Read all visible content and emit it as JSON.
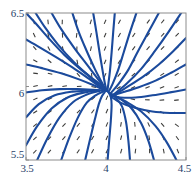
{
  "chart_data": {
    "type": "line",
    "title": "",
    "subtitle": "",
    "xlabel": "",
    "ylabel": "",
    "xlim": [
      3.5,
      4.5
    ],
    "ylim": [
      5.5,
      6.5
    ],
    "xticks": [
      3.5,
      4,
      4.5
    ],
    "xticklabels": [
      "3.5",
      "4",
      "4.5"
    ],
    "yticks": [
      5.5,
      6,
      6.5
    ],
    "yticklabels": [
      "5.5",
      "6",
      "6.5"
    ],
    "grid": false,
    "legend": null,
    "plot_kind": "phase-portrait-with-direction-field",
    "critical_point": {
      "x": 4.0,
      "y": 5.97,
      "classification": "stable node / sink"
    },
    "curve_color": "#1b4a9c",
    "field_color": "#3a3a38",
    "frame_color": "#8c8c8c",
    "label_color": "#2a3f6b",
    "background": "#ffffff",
    "trajectories": [
      {
        "name": "t1",
        "points": [
          [
            3.5,
            6.5
          ],
          [
            3.56,
            6.43
          ],
          [
            3.64,
            6.33
          ],
          [
            3.74,
            6.215
          ],
          [
            3.85,
            6.11
          ],
          [
            3.94,
            6.035
          ],
          [
            3.985,
            5.995
          ],
          [
            4.0,
            5.972
          ]
        ]
      },
      {
        "name": "t2",
        "points": [
          [
            3.5,
            6.32
          ],
          [
            3.58,
            6.27
          ],
          [
            3.68,
            6.205
          ],
          [
            3.79,
            6.13
          ],
          [
            3.89,
            6.055
          ],
          [
            3.96,
            6.0
          ],
          [
            4.0,
            5.972
          ]
        ]
      },
      {
        "name": "t3",
        "points": [
          [
            3.5,
            6.15
          ],
          [
            3.6,
            6.125
          ],
          [
            3.72,
            6.09
          ],
          [
            3.84,
            6.045
          ],
          [
            3.93,
            6.005
          ],
          [
            4.0,
            5.972
          ]
        ]
      },
      {
        "name": "t4",
        "points": [
          [
            3.56,
            6.5
          ],
          [
            3.62,
            6.4
          ],
          [
            3.7,
            6.285
          ],
          [
            3.8,
            6.165
          ],
          [
            3.9,
            6.065
          ],
          [
            3.965,
            6.0
          ],
          [
            4.0,
            5.972
          ]
        ]
      },
      {
        "name": "t5",
        "points": [
          [
            3.66,
            6.5
          ],
          [
            3.72,
            6.39
          ],
          [
            3.8,
            6.265
          ],
          [
            3.88,
            6.15
          ],
          [
            3.95,
            6.05
          ],
          [
            4.0,
            5.972
          ]
        ]
      },
      {
        "name": "t6",
        "points": [
          [
            3.79,
            6.5
          ],
          [
            3.83,
            6.37
          ],
          [
            3.88,
            6.24
          ],
          [
            3.93,
            6.12
          ],
          [
            3.975,
            6.025
          ],
          [
            4.0,
            5.972
          ]
        ]
      },
      {
        "name": "t7",
        "points": [
          [
            3.92,
            6.5
          ],
          [
            3.94,
            6.37
          ],
          [
            3.96,
            6.23
          ],
          [
            3.98,
            6.1
          ],
          [
            3.995,
            6.01
          ],
          [
            4.003,
            5.972
          ]
        ]
      },
      {
        "name": "t8",
        "points": [
          [
            4.055,
            6.5
          ],
          [
            4.045,
            6.37
          ],
          [
            4.035,
            6.23
          ],
          [
            4.025,
            6.11
          ],
          [
            4.015,
            6.02
          ],
          [
            4.008,
            5.968
          ]
        ]
      },
      {
        "name": "t9",
        "points": [
          [
            4.19,
            6.5
          ],
          [
            4.15,
            6.37
          ],
          [
            4.11,
            6.23
          ],
          [
            4.075,
            6.11
          ],
          [
            4.04,
            6.015
          ],
          [
            4.015,
            5.962
          ]
        ]
      },
      {
        "name": "t10",
        "points": [
          [
            4.33,
            6.5
          ],
          [
            4.265,
            6.37
          ],
          [
            4.2,
            6.24
          ],
          [
            4.14,
            6.115
          ],
          [
            4.08,
            6.02
          ],
          [
            4.03,
            5.955
          ]
        ]
      },
      {
        "name": "t11",
        "points": [
          [
            4.47,
            6.5
          ],
          [
            4.39,
            6.37
          ],
          [
            4.305,
            6.24
          ],
          [
            4.22,
            6.12
          ],
          [
            4.13,
            6.02
          ],
          [
            4.05,
            5.948
          ]
        ]
      },
      {
        "name": "t12",
        "points": [
          [
            4.5,
            6.33
          ],
          [
            4.42,
            6.24
          ],
          [
            4.33,
            6.15
          ],
          [
            4.23,
            6.065
          ],
          [
            4.13,
            5.995
          ],
          [
            4.055,
            5.944
          ]
        ]
      },
      {
        "name": "t13",
        "points": [
          [
            4.5,
            6.15
          ],
          [
            4.41,
            6.095
          ],
          [
            4.31,
            6.04
          ],
          [
            4.205,
            5.995
          ],
          [
            4.11,
            5.962
          ],
          [
            4.04,
            5.94
          ]
        ]
      },
      {
        "name": "t14",
        "points": [
          [
            4.5,
            5.98
          ],
          [
            4.4,
            5.96
          ],
          [
            4.29,
            5.94
          ],
          [
            4.185,
            5.925
          ],
          [
            4.09,
            5.925
          ],
          [
            4.03,
            5.938
          ]
        ]
      },
      {
        "name": "t15",
        "points": [
          [
            4.5,
            5.82
          ],
          [
            4.4,
            5.82
          ],
          [
            4.29,
            5.83
          ],
          [
            4.18,
            5.855
          ],
          [
            4.09,
            5.89
          ],
          [
            4.03,
            5.932
          ]
        ]
      },
      {
        "name": "t16",
        "points": [
          [
            4.44,
            5.5
          ],
          [
            4.38,
            5.62
          ],
          [
            4.31,
            5.73
          ],
          [
            4.22,
            5.83
          ],
          [
            4.12,
            5.9
          ],
          [
            4.04,
            5.945
          ]
        ]
      },
      {
        "name": "t17",
        "points": [
          [
            4.3,
            5.5
          ],
          [
            4.265,
            5.63
          ],
          [
            4.22,
            5.75
          ],
          [
            4.16,
            5.85
          ],
          [
            4.09,
            5.915
          ],
          [
            4.03,
            5.95
          ]
        ]
      },
      {
        "name": "t18",
        "points": [
          [
            4.15,
            5.5
          ],
          [
            4.14,
            5.63
          ],
          [
            4.125,
            5.76
          ],
          [
            4.1,
            5.865
          ],
          [
            4.06,
            5.925
          ],
          [
            4.02,
            5.955
          ]
        ]
      },
      {
        "name": "t19",
        "points": [
          [
            4.01,
            5.5
          ],
          [
            4.02,
            5.635
          ],
          [
            4.03,
            5.765
          ],
          [
            4.035,
            5.875
          ],
          [
            4.03,
            5.93
          ],
          [
            4.015,
            5.962
          ]
        ]
      },
      {
        "name": "t20",
        "points": [
          [
            3.87,
            5.5
          ],
          [
            3.9,
            5.64
          ],
          [
            3.93,
            5.775
          ],
          [
            3.955,
            5.88
          ],
          [
            3.975,
            5.935
          ],
          [
            3.995,
            5.966
          ]
        ]
      },
      {
        "name": "t21",
        "points": [
          [
            3.72,
            5.5
          ],
          [
            3.77,
            5.65
          ],
          [
            3.825,
            5.79
          ],
          [
            3.88,
            5.89
          ],
          [
            3.935,
            5.94
          ],
          [
            3.985,
            5.968
          ]
        ]
      },
      {
        "name": "t22",
        "points": [
          [
            3.57,
            5.5
          ],
          [
            3.635,
            5.65
          ],
          [
            3.71,
            5.79
          ],
          [
            3.795,
            5.895
          ],
          [
            3.88,
            5.945
          ],
          [
            3.96,
            5.97
          ]
        ]
      },
      {
        "name": "t23",
        "points": [
          [
            3.5,
            5.6
          ],
          [
            3.57,
            5.73
          ],
          [
            3.66,
            5.85
          ],
          [
            3.76,
            5.925
          ],
          [
            3.86,
            5.958
          ],
          [
            3.955,
            5.971
          ]
        ]
      },
      {
        "name": "t24",
        "points": [
          [
            3.5,
            5.79
          ],
          [
            3.58,
            5.88
          ],
          [
            3.68,
            5.94
          ],
          [
            3.79,
            5.965
          ],
          [
            3.89,
            5.972
          ],
          [
            3.96,
            5.972
          ]
        ]
      },
      {
        "name": "t25",
        "points": [
          [
            3.5,
            5.96
          ],
          [
            3.6,
            5.975
          ],
          [
            3.71,
            5.982
          ],
          [
            3.82,
            5.982
          ],
          [
            3.92,
            5.978
          ],
          [
            3.975,
            5.974
          ]
        ]
      }
    ],
    "field": {
      "nx": 11,
      "ny": 11,
      "marker": "short-line-segment",
      "note": "Direction-field slope marks sampled on an 11x11 grid across the domain."
    }
  }
}
